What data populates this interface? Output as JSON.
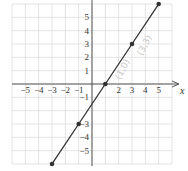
{
  "chart_data": {
    "type": "line",
    "title": "",
    "xlabel": "x",
    "ylabel": "",
    "xlim": [
      -6,
      6
    ],
    "ylim": [
      -6,
      6
    ],
    "grid": true,
    "x_ticks": [
      -5,
      -4,
      -3,
      -2,
      -1,
      2,
      3,
      4,
      5
    ],
    "y_ticks": [
      5,
      4,
      3,
      2,
      1,
      -1,
      -3,
      -4,
      -5
    ],
    "x_tick_labels": [
      "−5",
      "−4",
      "−3",
      "−2",
      "−1",
      "2",
      "3",
      "4",
      "5"
    ],
    "y_tick_labels": [
      "5",
      "4",
      "3",
      "2",
      "1",
      "−1",
      "−3",
      "−4",
      "−5"
    ],
    "series": [
      {
        "name": "y = 1.5x − 1.5",
        "x": [
          -3,
          -1,
          1,
          3,
          5
        ],
        "y": [
          -6,
          -3,
          0,
          3,
          6
        ],
        "marked_points": [
          [
            -3,
            -6
          ],
          [
            -1,
            -3
          ],
          [
            1,
            0
          ],
          [
            3,
            3
          ],
          [
            5,
            6
          ]
        ],
        "color": "#333333"
      }
    ],
    "annotations": [
      "(1,0)",
      "(3,3)"
    ]
  },
  "colors": {
    "grid": "#d9d9d9",
    "axis": "#444444",
    "line": "#333333",
    "annotation": "#c8c8c8"
  }
}
